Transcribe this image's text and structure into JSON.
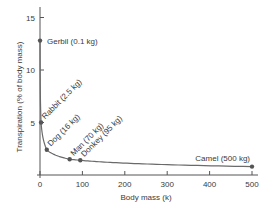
{
  "chart_data": {
    "type": "line",
    "title": "",
    "xlabel": "Body mass (k)",
    "ylabel": "Transpiration (% of body mass)",
    "xlim": [
      0,
      500
    ],
    "ylim": [
      0,
      16
    ],
    "x_ticks": [
      0,
      100,
      200,
      300,
      400,
      500
    ],
    "y_ticks": [
      5,
      10,
      15
    ],
    "grid": false,
    "legend": null,
    "series": [
      {
        "name": "Transpiration vs body mass",
        "points": [
          {
            "label": "Gerbil (0.1 kg)",
            "x": 0.1,
            "y": 12.8
          },
          {
            "label": "Rabbit (2.5 kg)",
            "x": 2.5,
            "y": 5.0
          },
          {
            "label": "Dog (16 kg)",
            "x": 16,
            "y": 2.4
          },
          {
            "label": "Man (70 kg)",
            "x": 70,
            "y": 1.5
          },
          {
            "label": "Donkey (95 kg)",
            "x": 95,
            "y": 1.4
          },
          {
            "label": "Camel (500 kg)",
            "x": 500,
            "y": 0.8
          }
        ]
      }
    ]
  },
  "colors": {
    "axis": "#555555",
    "line": "#6a6a6a",
    "marker": "#555555",
    "text": "#3a3a3a"
  }
}
